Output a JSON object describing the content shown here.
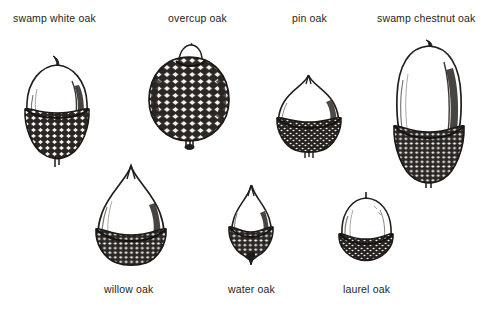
{
  "plate": {
    "title": "Acorn identification plate",
    "background_color": "#ffffff",
    "ink_color": "#231f20",
    "width": 490,
    "height": 315
  },
  "figures": [
    {
      "id": "swamp-white-oak",
      "label": "swamp white oak",
      "label_position": "top",
      "row": 1,
      "nut_shape": "broadly ovoid, rounded shoulders, short beak",
      "cap_depth": "covers lower half, fringed rim",
      "stalk": "short curved stalk at apex",
      "relative_size": "medium-large"
    },
    {
      "id": "overcup-oak",
      "label": "overcup oak",
      "label_position": "top",
      "row": 1,
      "nut_shape": "nearly spherical, almost wholly enclosed",
      "cap_depth": "encloses nearly the entire nut, only tip exposed",
      "stalk": "stubby knob at base",
      "relative_size": "large"
    },
    {
      "id": "pin-oak",
      "label": "pin oak",
      "label_position": "top",
      "row": 1,
      "nut_shape": "hemispheric with a small sharp point",
      "cap_depth": "shallow saucer, lower third",
      "stalk": "tiny stalk at base",
      "relative_size": "medium"
    },
    {
      "id": "swamp-chestnut-oak",
      "label": "swamp chestnut oak",
      "label_position": "top",
      "row": 1,
      "nut_shape": "tall elongated ovoid",
      "cap_depth": "deep bowl, covers lower third",
      "stalk": "short stalk at apex",
      "relative_size": "largest"
    },
    {
      "id": "willow-oak",
      "label": "willow oak",
      "label_position": "bottom",
      "row": 2,
      "nut_shape": "conical, sharply pointed apex",
      "cap_depth": "shallow, thick rimmed",
      "stalk": "none visible",
      "relative_size": "medium"
    },
    {
      "id": "water-oak",
      "label": "water oak",
      "label_position": "bottom",
      "row": 2,
      "nut_shape": "small conical, pointed apex",
      "cap_depth": "shallow with pointed base",
      "stalk": "pointed nub at base",
      "relative_size": "small"
    },
    {
      "id": "laurel-oak",
      "label": "laurel oak",
      "label_position": "bottom",
      "row": 2,
      "nut_shape": "squat, broadly rounded, flattened",
      "cap_depth": "very shallow, thin band",
      "stalk": "tiny stalk at apex",
      "relative_size": "smallest"
    }
  ]
}
